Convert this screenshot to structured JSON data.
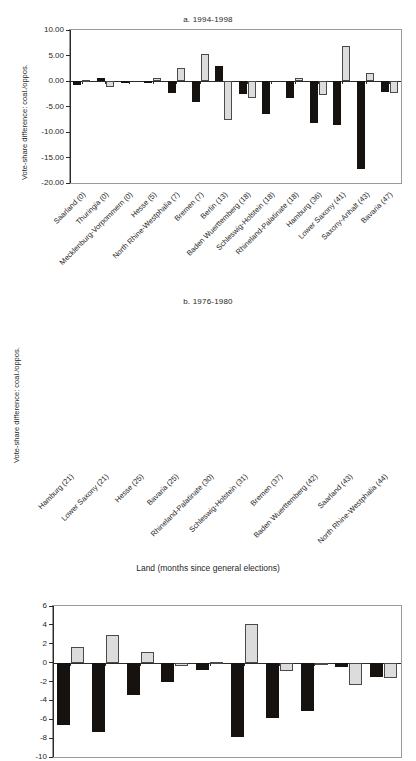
{
  "figure": {
    "xlabel": "Land (months since general elections)",
    "ylabel": "Vote-share difference: coal./oppos.",
    "colors": {
      "dark_series": "#161210",
      "light_series": "#dcdcdc",
      "axis": "#2b2b2b",
      "frame": "#9a9a9a"
    }
  },
  "chart_data": [
    {
      "type": "bar",
      "panel": "a",
      "title": "a. 1994-1998",
      "xlabel": "",
      "ylabel": "Vote-share difference: coal./oppos.",
      "ylim": [
        -20.0,
        10.0
      ],
      "yticks": [
        "10.00",
        "5.00",
        "0.00",
        "-5.00",
        "-10.00",
        "-15.00",
        "-20.00"
      ],
      "ytick_values": [
        10.0,
        5.0,
        0.0,
        -5.0,
        -10.0,
        -15.0,
        -20.0
      ],
      "grid": false,
      "legend": "none",
      "categories": [
        "Saarland (0)",
        "Thuringia (0)",
        "Mecklenburg-Vorpommern (0)",
        "Hesse (5)",
        "North Rhine-Westphalia (7)",
        "Bremen (7)",
        "Berlin (13)",
        "Baden Wuerttemberg (18)",
        "Schleswig-Holstein (18)",
        "Rhineland-Palatinate (18)",
        "Hamburg (36)",
        "Lower Saxony (41)",
        "Saxony-Anhalt (43)",
        "Bavaria (47)"
      ],
      "series": [
        {
          "name": "dark",
          "values": [
            -0.7,
            0.6,
            -0.2,
            -0.3,
            -2.3,
            -4.1,
            2.9,
            -2.6,
            -6.4,
            -3.3,
            -8.2,
            -8.6,
            -17.2,
            -2.1
          ]
        },
        {
          "name": "light",
          "values": [
            0.15,
            -1.2,
            0.0,
            0.55,
            2.5,
            5.3,
            -7.7,
            -3.4,
            0.0,
            0.6,
            -2.7,
            6.8,
            1.6,
            -2.3
          ]
        }
      ]
    },
    {
      "type": "bar",
      "panel": "b",
      "title": "b. 1976-1980",
      "xlabel": "Land (months since general elections)",
      "ylabel": "Vote-share difference: coal./oppos.",
      "ylim": [
        -10,
        6
      ],
      "yticks": [
        "6",
        "4",
        "2",
        "0",
        "-2",
        "-4",
        "-6",
        "-8",
        "-10"
      ],
      "ytick_values": [
        6,
        4,
        2,
        0,
        -2,
        -4,
        -6,
        -8,
        -10
      ],
      "grid": false,
      "legend": "none",
      "categories": [
        "Hamburg (21)",
        "Lower Saxony (21)",
        "Hesse (25)",
        "Bavaria (25)",
        "Rhineland-Palatinate (30)",
        "Schleswig-Holstein (31)",
        "Bremen (37)",
        "Baden Wuerttemberg (42)",
        "Saarland (43)",
        "North Rhine-Westphalia (44)"
      ],
      "series": [
        {
          "name": "dark",
          "values": [
            -6.6,
            -7.3,
            -3.4,
            -2.1,
            -0.8,
            -7.9,
            -5.9,
            -5.1,
            -0.5,
            -1.5
          ]
        },
        {
          "name": "light",
          "values": [
            1.7,
            2.9,
            1.1,
            -0.4,
            0.1,
            4.1,
            -0.9,
            -0.15,
            -2.4,
            -1.6
          ]
        }
      ]
    }
  ]
}
